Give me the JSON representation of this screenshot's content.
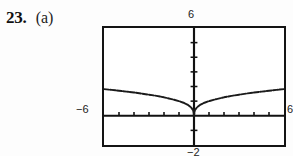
{
  "problem": {
    "number": "23.",
    "part": "(a)"
  },
  "graph": {
    "range_labels": {
      "ymax": "6",
      "xmin": "−6",
      "xmax": "6",
      "ymin": "−2"
    },
    "axis_colors": {
      "frame": "#141414",
      "axis": "#111111",
      "curve": "#1b1b1b"
    }
  },
  "chart_data": {
    "type": "line",
    "title": "",
    "xlabel": "",
    "ylabel": "",
    "xlim": [
      -6,
      6
    ],
    "ylim": [
      -2,
      6
    ],
    "grid": false,
    "legend": null,
    "axis_ticks": {
      "x_interval": 1,
      "y_interval": 1,
      "x_ticks": [
        -5,
        -4,
        -3,
        -2,
        -1,
        1,
        2,
        3,
        4,
        5
      ],
      "y_ticks": [
        -1,
        1,
        2,
        3,
        4,
        5
      ]
    },
    "series": [
      {
        "name": "y = |x|^(1/3)",
        "x": [
          -6.0,
          -5.5,
          -5.0,
          -4.5,
          -4.0,
          -3.5,
          -3.0,
          -2.5,
          -2.0,
          -1.5,
          -1.0,
          -0.7,
          -0.4,
          -0.2,
          -0.05,
          0.0,
          0.05,
          0.2,
          0.4,
          0.7,
          1.0,
          1.5,
          2.0,
          2.5,
          3.0,
          3.5,
          4.0,
          4.5,
          5.0,
          5.5,
          6.0
        ],
        "y": [
          1.82,
          1.77,
          1.71,
          1.65,
          1.59,
          1.52,
          1.44,
          1.36,
          1.26,
          1.14,
          1.0,
          0.89,
          0.74,
          0.58,
          0.37,
          0.0,
          0.37,
          0.58,
          0.74,
          0.89,
          1.0,
          1.14,
          1.26,
          1.36,
          1.44,
          1.52,
          1.59,
          1.65,
          1.71,
          1.77,
          1.82
        ]
      }
    ]
  }
}
